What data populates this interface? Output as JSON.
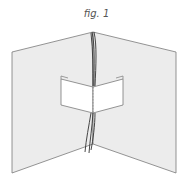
{
  "figure": {
    "caption": "fig. 1",
    "colors": {
      "panel_fill": "#ececec",
      "panel_stroke": "#7a7a7a",
      "popup_fill": "#ffffff",
      "ribbon": "#333333"
    }
  }
}
